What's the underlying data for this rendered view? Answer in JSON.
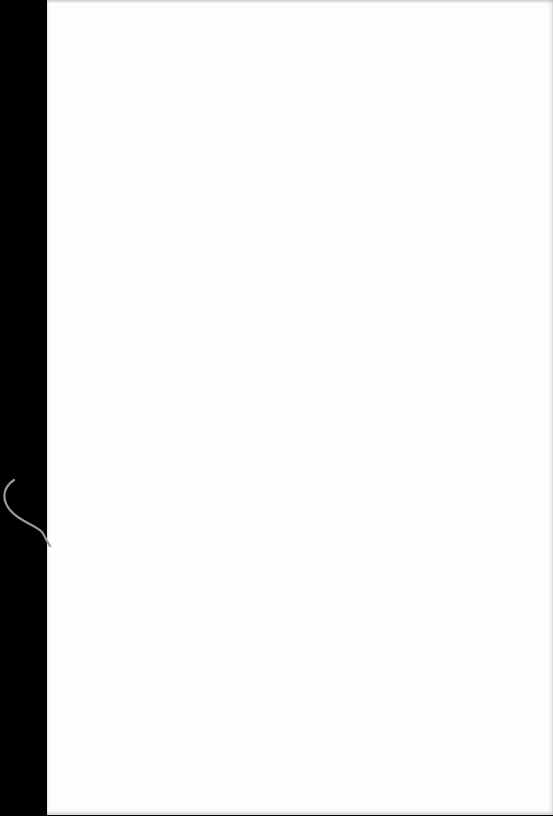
{
  "document": {
    "type": "scanned-page",
    "content": "",
    "colors": {
      "border": "#000000",
      "paper": "#fdfdfd",
      "artifact": "#9a9a9a"
    }
  }
}
